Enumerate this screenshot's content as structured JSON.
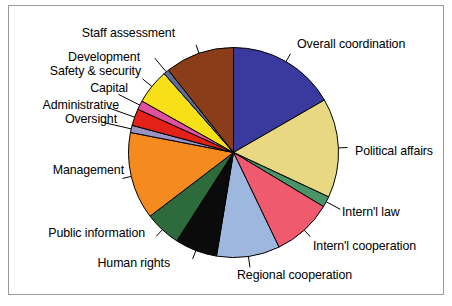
{
  "chart_data": {
    "type": "pie",
    "title": "",
    "subtitle": "",
    "xlabel": "",
    "ylabel": "",
    "legend_position": "none",
    "labels_position": "outside-with-leader-lines",
    "grid": false,
    "start_angle_deg": 0,
    "direction": "clockwise",
    "categories": [
      "Overall coordination",
      "Political affairs",
      "Intern'l law",
      "Intern'l cooperation",
      "Regional cooperation",
      "Human rights",
      "Public information",
      "Management",
      "Oversight",
      "Administrative",
      "Capital",
      "Safety & security",
      "Development",
      "Staff assessment"
    ],
    "values": [
      18.0,
      16.5,
      1.8,
      10.0,
      10.5,
      7.0,
      6.0,
      14.5,
      1.2,
      2.8,
      1.5,
      5.8,
      0.9,
      11.5
    ],
    "colors": [
      "#3a3a9e",
      "#e8d882",
      "#4a9468",
      "#ef5a6e",
      "#9db7de",
      "#0b0b0b",
      "#2d6b3c",
      "#f58a1f",
      "#9a93c4",
      "#e32119",
      "#e0509e",
      "#f7e017",
      "#5a6e96",
      "#8a3d18"
    ],
    "slices": [
      {
        "label": "Overall coordination",
        "value": 18.0,
        "color": "#3a3a9e"
      },
      {
        "label": "Political affairs",
        "value": 16.5,
        "color": "#e8d882"
      },
      {
        "label": "Intern'l law",
        "value": 1.8,
        "color": "#4a9468"
      },
      {
        "label": "Intern'l cooperation",
        "value": 10.0,
        "color": "#ef5a6e"
      },
      {
        "label": "Regional cooperation",
        "value": 10.5,
        "color": "#9db7de"
      },
      {
        "label": "Human rights",
        "value": 7.0,
        "color": "#0b0b0b"
      },
      {
        "label": "Public information",
        "value": 6.0,
        "color": "#2d6b3c"
      },
      {
        "label": "Management",
        "value": 14.5,
        "color": "#f58a1f"
      },
      {
        "label": "Oversight",
        "value": 1.2,
        "color": "#9a93c4"
      },
      {
        "label": "Administrative",
        "value": 2.8,
        "color": "#e32119"
      },
      {
        "label": "Capital",
        "value": 1.5,
        "color": "#e0509e"
      },
      {
        "label": "Safety & security",
        "value": 5.8,
        "color": "#f7e017"
      },
      {
        "label": "Development",
        "value": 0.9,
        "color": "#5a6e96"
      },
      {
        "label": "Staff assessment",
        "value": 11.5,
        "color": "#8a3d18"
      }
    ]
  },
  "labels": {
    "overall_coordination": "Overall coordination",
    "political_affairs": "Political affairs",
    "internl_law": "Intern'l law",
    "internl_cooperation": "Intern'l cooperation",
    "regional_cooperation": "Regional cooperation",
    "human_rights": "Human rights",
    "public_information": "Public information",
    "management": "Management",
    "oversight": "Oversight",
    "administrative": "Administrative",
    "capital": "Capital",
    "safety_security": "Safety & security",
    "development": "Development",
    "staff_assessment": "Staff assessment"
  },
  "style": {
    "background": "#ffffff",
    "frame_border": "#9a9a9a",
    "slice_outline": "#000000",
    "leader_line": "#000000",
    "label_text": "#000000"
  }
}
